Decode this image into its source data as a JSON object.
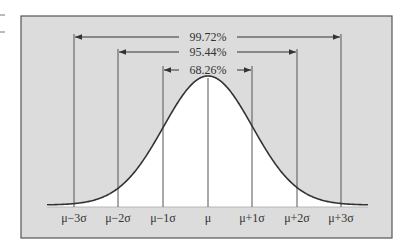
{
  "diagram": {
    "colors": {
      "background": "#dcdcdc",
      "frame": "#555555",
      "curve_fill": "#ffffff",
      "curve": "#333333",
      "line": "#555555"
    },
    "intervals": [
      {
        "label": "99.72%",
        "from": "μ−3σ",
        "to": "μ+3σ"
      },
      {
        "label": "95.44%",
        "from": "μ−2σ",
        "to": "μ+2σ"
      },
      {
        "label": "68.26%",
        "from": "μ−1σ",
        "to": "μ+1σ"
      }
    ],
    "axis_labels": [
      "μ−3σ",
      "μ−2σ",
      "μ−1σ",
      "μ",
      "μ+1σ",
      "μ+2σ",
      "μ+3σ"
    ]
  }
}
